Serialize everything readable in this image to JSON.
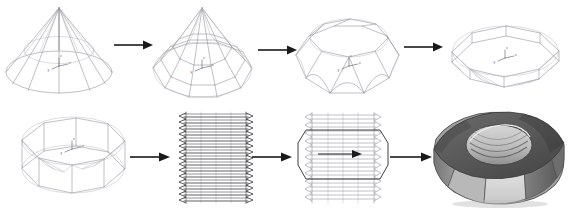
{
  "figure": {
    "background_color": "#ffffff",
    "width": 570,
    "height": 210,
    "wireframe_color": "#8c8c94",
    "arrow_color": "#1a1a1a",
    "thread_color": "#3c3c42",
    "render_light_color": "#e8e8e8",
    "render_mid_color": "#a8a8a8",
    "render_dark_color": "#585858"
  },
  "axis_gizmo": {
    "x_label": "x",
    "y_label": "y",
    "z_label": "z"
  },
  "steps": [
    {
      "index": 1,
      "name": "cone-wireframe",
      "label": "Cone wireframe",
      "row": "top",
      "description": "Smooth revolved cone with apex, circular base and radial meridian lines"
    },
    {
      "index": 2,
      "name": "faceted-cone",
      "label": "Faceted cone",
      "row": "top",
      "description": "Cone subdivided into hexagonal facets with flat side panels"
    },
    {
      "index": 3,
      "name": "truncated-cone",
      "label": "Truncated cone",
      "row": "top",
      "description": "Apex removed leaving a flat top face on the faceted body"
    },
    {
      "index": 4,
      "name": "flattened-disc",
      "label": "Flattened disc",
      "row": "top",
      "description": "Body compressed vertically into a thin chamfered hexagonal disc"
    },
    {
      "index": 5,
      "name": "thickened-ring",
      "label": "Thickened hex ring",
      "row": "bottom",
      "description": "Disc extruded to full nut height forming a hexagonal ring blank"
    },
    {
      "index": 6,
      "name": "threaded-cylinder",
      "label": "Threaded cylinder",
      "row": "bottom",
      "description": "Helical thread profile swept into a dense threaded cylinder"
    },
    {
      "index": 7,
      "name": "boolean-intersection",
      "label": "Boolean intersection",
      "row": "bottom",
      "description": "Threaded cylinder combined with hexagonal outline via boolean operation"
    },
    {
      "index": 8,
      "name": "rendered-hex-nut",
      "label": "Rendered hex nut",
      "row": "bottom",
      "description": "Final shaded hexagonal nut with internal threaded bore"
    }
  ],
  "arrows": [
    {
      "name": "arrow-1",
      "from_step": 1,
      "to_step": 2,
      "direction": "right"
    },
    {
      "name": "arrow-2",
      "from_step": 2,
      "to_step": 3,
      "direction": "right"
    },
    {
      "name": "arrow-3",
      "from_step": 3,
      "to_step": 4,
      "direction": "right"
    },
    {
      "name": "arrow-4",
      "from_step": 5,
      "to_step": 6,
      "direction": "right"
    },
    {
      "name": "arrow-5",
      "from_step": 6,
      "to_step": 7,
      "direction": "right"
    },
    {
      "name": "arrow-6",
      "from_step": 7,
      "to_step": 8,
      "direction": "right"
    }
  ]
}
